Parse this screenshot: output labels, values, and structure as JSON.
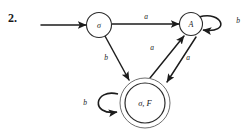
{
  "diagram": {
    "exercise_number": "2.",
    "type": "finite-state-machine",
    "states": [
      {
        "id": "start",
        "label": "σ",
        "accepting": false
      },
      {
        "id": "a-state",
        "label": "A",
        "accepting": false
      },
      {
        "id": "final",
        "label": "σ, F",
        "accepting": true
      }
    ],
    "transitions": [
      {
        "from": "start",
        "to": "a-state",
        "label": "a"
      },
      {
        "from": "start",
        "to": "final",
        "label": "b"
      },
      {
        "from": "final",
        "to": "a-state",
        "label": "a"
      },
      {
        "from": "a-state",
        "to": "final",
        "label": "a"
      },
      {
        "from": "a-state",
        "to": "a-state",
        "label": "b"
      },
      {
        "from": "final",
        "to": "final",
        "label": "b"
      }
    ],
    "colors": {
      "background": "#ffffff",
      "ink": "#1c1c1c",
      "outer_ring": "#6e6e6e"
    }
  }
}
